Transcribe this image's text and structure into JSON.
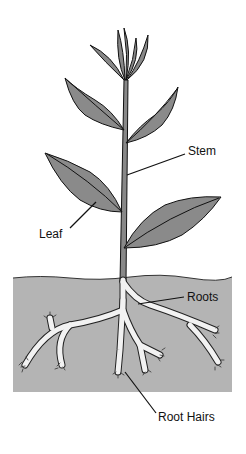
{
  "diagram": {
    "labels": {
      "stem": "Stem",
      "leaf": "Leaf",
      "roots": "Roots",
      "root_hairs": "Root Hairs"
    },
    "colors": {
      "leaf_fill": "#8a8a8a",
      "soil_fill": "#b4b4b4",
      "root_fill": "#f2f2f2",
      "line": "#111111",
      "background": "#ffffff"
    }
  }
}
